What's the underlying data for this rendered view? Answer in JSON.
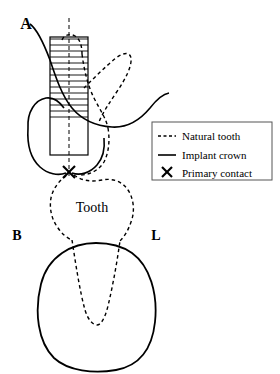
{
  "figure": {
    "background_color": "#ffffff",
    "line_color": "#000000",
    "width": 280,
    "height": 374
  },
  "labels": {
    "a_label": "A",
    "b_label": "B",
    "l_label": "L",
    "tooth_label": "Tooth"
  },
  "legend": {
    "items": [
      {
        "key": "natural-tooth",
        "label": "Natural tooth",
        "style": "dashed",
        "sample": "dashed-line"
      },
      {
        "key": "implant-crown",
        "label": "Implant crown",
        "style": "solid",
        "sample": "solid-line"
      },
      {
        "key": "primary-contact",
        "label": "Primary contact",
        "style": "marker",
        "sample": "x-marker"
      }
    ],
    "box": {
      "x": 152,
      "y": 122,
      "width": 120,
      "height": 58
    }
  },
  "markers": {
    "primary_contact": {
      "x": 69,
      "y": 172,
      "glyph": "X"
    }
  },
  "elements": {
    "hatched_post": {
      "name": "hatched-implant-post",
      "x": 50,
      "y": 37,
      "width": 38,
      "height": 118,
      "hatch_end_y": 120,
      "hatch_spacing": 6
    },
    "center_axis": {
      "x": 69,
      "y_top": 18,
      "y_bottom": 177,
      "style": "dashed"
    }
  }
}
